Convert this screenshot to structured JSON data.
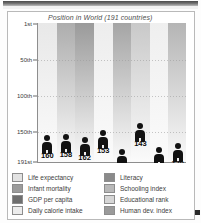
{
  "chart_title": "Position in World (191 countries)",
  "chart_data": {
    "type": "bar",
    "title": "Position in World (191 countries)",
    "xlabel": "",
    "ylabel": "",
    "ylim": [
      1,
      191
    ],
    "y_inverted": true,
    "grid": true,
    "legend_position": "bottom",
    "ytick_labels": [
      "1st",
      "50th",
      "100th",
      "150th",
      "191st"
    ],
    "ytick_values": [
      1,
      50,
      100,
      150,
      191
    ],
    "categories": [
      "Life expectancy",
      "Infant mortality",
      "GDP per capita",
      "Daily calorie intake",
      "Literacy",
      "Schooling index",
      "Educational rank",
      "Human dev. index"
    ],
    "values": [
      160,
      158,
      162,
      153,
      179,
      143,
      176,
      170
    ],
    "value_labels": [
      "160",
      "158",
      "162",
      "153",
      "179",
      "143",
      "176",
      "170"
    ],
    "band_colors": [
      "#e8e8e8",
      "#adadad",
      "#9a9a9a",
      "#ededed",
      "#a5a5a5",
      "#c9c9c9",
      "#efefef",
      "#b5b5b5"
    ],
    "marker": "human-figure-pictogram",
    "marker_color": "#121212"
  },
  "legend": {
    "left": [
      {
        "label": "Life expectancy",
        "color": "#e2e2e2"
      },
      {
        "label": "Infant mortality",
        "color": "#9c9c9c"
      },
      {
        "label": "GDP per capita",
        "color": "#6f6f6f"
      },
      {
        "label": "Daily calorie intake",
        "color": "#ededed"
      }
    ],
    "right": [
      {
        "label": "Literacy",
        "color": "#8a8a8a"
      },
      {
        "label": "Schooling index",
        "color": "#b8b8b8"
      },
      {
        "label": "Educational rank",
        "color": "#d6d6d6"
      },
      {
        "label": "Human dev. index",
        "color": "#9a9a9a"
      }
    ]
  }
}
